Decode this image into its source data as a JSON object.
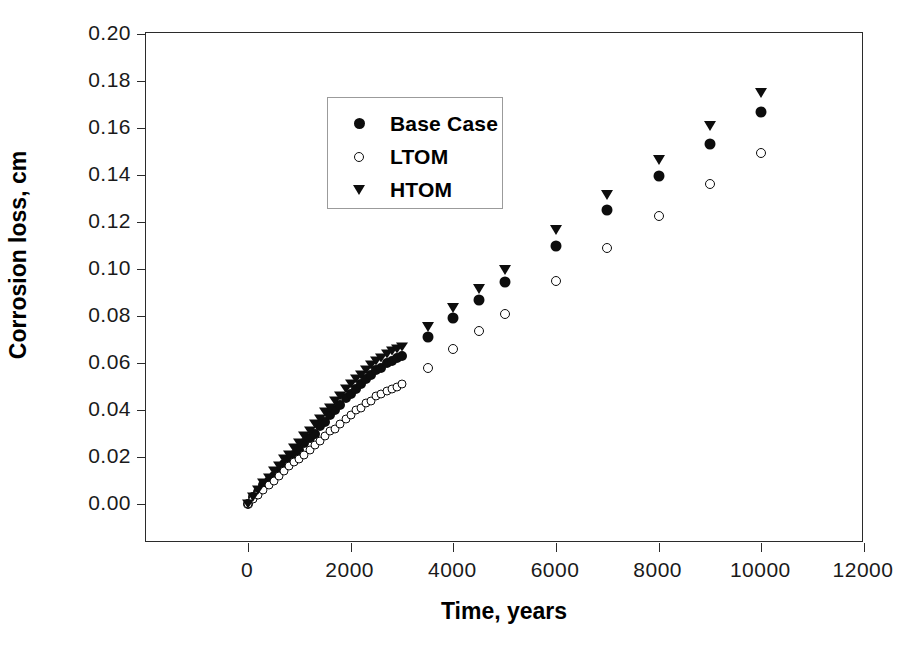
{
  "chart_data": {
    "type": "scatter",
    "title": "",
    "xlabel": "Time, years",
    "ylabel": "Corrosion loss, cm",
    "xlim": [
      -1200,
      12800
    ],
    "ylim": [
      0.0,
      0.2
    ],
    "xticks": [
      0,
      2000,
      4000,
      6000,
      8000,
      10000,
      12000
    ],
    "xtick_labels": [
      "0",
      "2000",
      "4000",
      "6000",
      "8000",
      "10000",
      "12000"
    ],
    "yticks": [
      0.0,
      0.02,
      0.04,
      0.06,
      0.08,
      0.1,
      0.12,
      0.14,
      0.16,
      0.18,
      0.2
    ],
    "ytick_labels": [
      "0.00",
      "0.02",
      "0.04",
      "0.06",
      "0.08",
      "0.10",
      "0.12",
      "0.14",
      "0.16",
      "0.18",
      "0.20"
    ],
    "grid": false,
    "legend_position": "upper left",
    "series": [
      {
        "name": "Base Case",
        "marker": "filled-circle",
        "color": "#0d0d0d",
        "x": [
          0,
          100,
          200,
          300,
          400,
          500,
          600,
          700,
          800,
          900,
          1000,
          1100,
          1200,
          1300,
          1400,
          1500,
          1600,
          1700,
          1800,
          1900,
          2000,
          2100,
          2200,
          2300,
          2400,
          2500,
          2600,
          2700,
          2800,
          2900,
          3000,
          3500,
          4000,
          4500,
          5000,
          6000,
          7000,
          8000,
          9000,
          10000
        ],
        "y": [
          0.0,
          0.003,
          0.005,
          0.008,
          0.01,
          0.012,
          0.014,
          0.017,
          0.019,
          0.021,
          0.023,
          0.026,
          0.028,
          0.03,
          0.033,
          0.035,
          0.038,
          0.04,
          0.042,
          0.045,
          0.047,
          0.049,
          0.051,
          0.053,
          0.055,
          0.057,
          0.058,
          0.06,
          0.061,
          0.062,
          0.063,
          0.071,
          0.079,
          0.087,
          0.0945,
          0.11,
          0.125,
          0.1395,
          0.153,
          0.167
        ]
      },
      {
        "name": "LTOM",
        "marker": "open-circle",
        "color": "#0d0d0d",
        "x": [
          0,
          100,
          200,
          300,
          400,
          500,
          600,
          700,
          800,
          900,
          1000,
          1100,
          1200,
          1300,
          1400,
          1500,
          1600,
          1700,
          1800,
          1900,
          2000,
          2100,
          2200,
          2300,
          2400,
          2500,
          2600,
          2700,
          2800,
          2900,
          3000,
          3500,
          4000,
          4500,
          5000,
          6000,
          7000,
          8000,
          9000,
          10000
        ],
        "y": [
          0.0,
          0.002,
          0.004,
          0.006,
          0.008,
          0.01,
          0.012,
          0.014,
          0.016,
          0.018,
          0.019,
          0.021,
          0.023,
          0.025,
          0.027,
          0.029,
          0.031,
          0.032,
          0.034,
          0.036,
          0.038,
          0.04,
          0.041,
          0.043,
          0.044,
          0.046,
          0.047,
          0.048,
          0.049,
          0.05,
          0.051,
          0.058,
          0.066,
          0.0735,
          0.081,
          0.095,
          0.109,
          0.1225,
          0.136,
          0.1495
        ]
      },
      {
        "name": "HTOM",
        "marker": "triangle-down",
        "color": "#0d0d0d",
        "x": [
          0,
          100,
          200,
          300,
          400,
          500,
          600,
          700,
          800,
          900,
          1000,
          1100,
          1200,
          1300,
          1400,
          1500,
          1600,
          1700,
          1800,
          1900,
          2000,
          2100,
          2200,
          2300,
          2400,
          2500,
          2600,
          2700,
          2800,
          2900,
          3000,
          3500,
          4000,
          4500,
          5000,
          6000,
          7000,
          8000,
          9000,
          10000
        ],
        "y": [
          0.0,
          0.003,
          0.006,
          0.009,
          0.011,
          0.014,
          0.016,
          0.019,
          0.021,
          0.024,
          0.026,
          0.029,
          0.031,
          0.034,
          0.036,
          0.039,
          0.041,
          0.044,
          0.046,
          0.049,
          0.051,
          0.053,
          0.055,
          0.057,
          0.059,
          0.061,
          0.062,
          0.064,
          0.065,
          0.066,
          0.067,
          0.0755,
          0.0835,
          0.0915,
          0.0995,
          0.1165,
          0.1315,
          0.1465,
          0.161,
          0.175
        ]
      }
    ]
  },
  "axes": {
    "ylabel": "Corrosion loss, cm",
    "xlabel": "Time, years"
  },
  "legend": {
    "items": [
      {
        "label": "Base Case",
        "marker": "filled-circle"
      },
      {
        "label": "LTOM",
        "marker": "open-circle"
      },
      {
        "label": "HTOM",
        "marker": "triangle-down"
      }
    ]
  }
}
